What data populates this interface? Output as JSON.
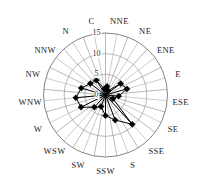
{
  "chart_data": {
    "type": "line",
    "subtype": "wind-rose-polar",
    "title": "",
    "xlabel": "",
    "ylabel": "",
    "grid": true,
    "legend": null,
    "radial_ticks": [
      "0",
      "5",
      "10",
      "15"
    ],
    "radial_tick_values": [
      0,
      5,
      10,
      15
    ],
    "rlim": [
      0,
      15
    ],
    "categories": [
      "NNE",
      "NE",
      "ENE",
      "E",
      "ESE",
      "SE",
      "SSE",
      "S",
      "SSW",
      "SW",
      "WSW",
      "W",
      "WNW",
      "NW",
      "NNW",
      "N",
      "C"
    ],
    "angle_labels": {
      "NNE": "NNE",
      "NE": "NE",
      "ENE": "ENE",
      "E": "E",
      "ESE": "ESE",
      "SE": "SE",
      "SSE": "SSE",
      "S": "S",
      "SSW": "SSW",
      "SW": "SW",
      "WSW": "WSW",
      "W": "W",
      "WNW": "WNW",
      "NW": "NW",
      "NNW": "NNW",
      "N": "N",
      "C": "C"
    },
    "series": [
      {
        "name": "frequency",
        "closed": false,
        "values": [
          2.1,
          1.2,
          4.6,
          5.4,
          3.2,
          2.0,
          9.6,
          6.5,
          5.0,
          3.0,
          4.0,
          6.6,
          7.2,
          6.1,
          4.6,
          4.2,
          1.5
        ]
      }
    ],
    "points": [
      {
        "category": "NNE",
        "value": 2.1
      },
      {
        "category": "NE",
        "value": 1.2
      },
      {
        "category": "ENE",
        "value": 4.6
      },
      {
        "category": "E",
        "value": 5.4
      },
      {
        "category": "ESE",
        "value": 3.2
      },
      {
        "category": "SE",
        "value": 2.0
      },
      {
        "category": "SSE",
        "value": 9.6
      },
      {
        "category": "S",
        "value": 6.5
      },
      {
        "category": "SSW",
        "value": 5.0
      },
      {
        "category": "SW",
        "value": 3.0
      },
      {
        "category": "WSW",
        "value": 4.0
      },
      {
        "category": "W",
        "value": 6.6
      },
      {
        "category": "WNW",
        "value": 7.2
      },
      {
        "category": "NW",
        "value": 6.1
      },
      {
        "category": "NNW",
        "value": 4.6
      },
      {
        "category": "N",
        "value": 4.2
      },
      {
        "category": "C",
        "value": 1.5
      }
    ],
    "colors": {
      "marker": "#000000",
      "line": "#000000",
      "grid": "#8a8a8a",
      "background": "#ffffff",
      "text": "#222222"
    }
  }
}
